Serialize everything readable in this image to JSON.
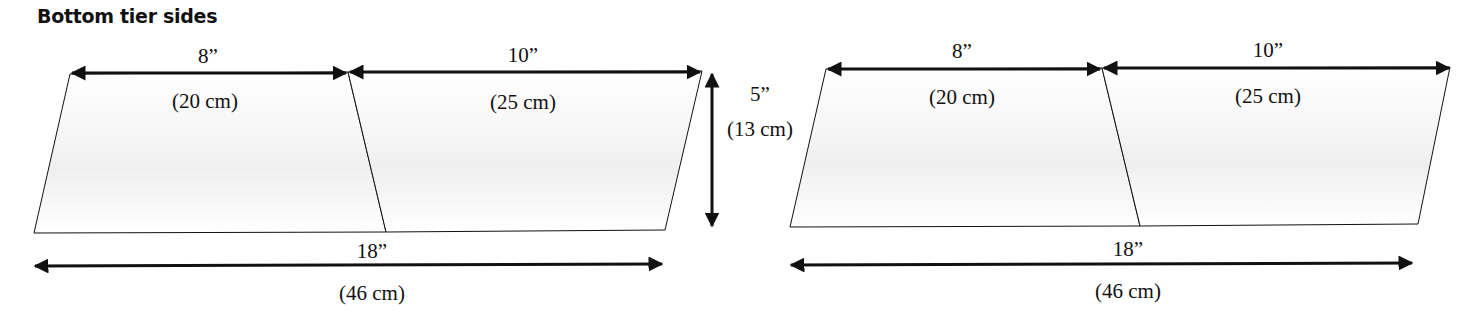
{
  "title": "Bottom tier sides",
  "colors": {
    "line": "#111111",
    "panel_fill": "#ffffff",
    "panel_shade": "#f2f2f2"
  },
  "panels": [
    {
      "name": "left-panel",
      "top_left_width": "8”",
      "top_left_width_cm": "(20 cm)",
      "top_right_width": "10”",
      "top_right_width_cm": "(25 cm)",
      "height": "5”",
      "height_cm": "(13 cm)",
      "bottom_width": "18”",
      "bottom_width_cm": "(46 cm)"
    },
    {
      "name": "right-panel",
      "top_left_width": "8”",
      "top_left_width_cm": "(20 cm)",
      "top_right_width": "10”",
      "top_right_width_cm": "(25 cm)",
      "bottom_width": "18”",
      "bottom_width_cm": "(46 cm)"
    }
  ]
}
